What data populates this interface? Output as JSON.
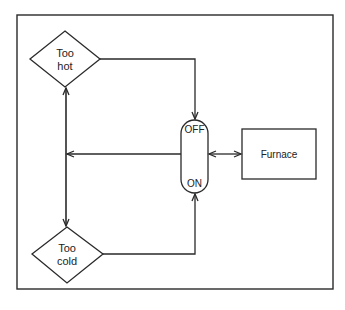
{
  "diagram": {
    "nodes": {
      "too_hot": {
        "line1": "Too",
        "line2": "hot",
        "shape": "diamond"
      },
      "too_cold": {
        "line1": "Too",
        "line2": "cold",
        "shape": "diamond"
      },
      "switch": {
        "top_label": "OFF",
        "bottom_label": "ON",
        "shape": "pill"
      },
      "furnace": {
        "label": "Furnace",
        "shape": "rectangle"
      }
    },
    "edges": [
      {
        "from": "too_hot",
        "to": "switch.OFF",
        "arrow": "end"
      },
      {
        "from": "too_cold",
        "to": "switch.ON",
        "arrow": "end"
      },
      {
        "from": "switch",
        "to": "furnace",
        "arrow": "both"
      },
      {
        "from": "switch",
        "to": "feedback-line",
        "arrow": "end"
      },
      {
        "from": "feedback-line",
        "to": "too_hot",
        "arrow": "end"
      },
      {
        "from": "feedback-line",
        "to": "too_cold",
        "arrow": "end"
      }
    ],
    "colors": {
      "stroke": "#2a2a2a",
      "background": "#ffffff"
    }
  }
}
